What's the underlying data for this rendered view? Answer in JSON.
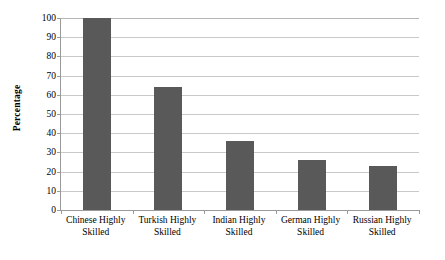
{
  "chart_data": {
    "type": "bar",
    "title": "",
    "xlabel": "",
    "ylabel": "Percentage",
    "ylim": [
      0,
      100
    ],
    "ytick_step": 10,
    "grid": true,
    "legend": "none",
    "bar_color": "#595959",
    "gridline_color": "#c9c9c9",
    "axis_color": "#9a9a9a",
    "categories": [
      "Chinese Highly Skilled",
      "Turkish Highly Skilled",
      "Indian Highly Skilled",
      "German Highly Skilled",
      "Russian Highly Skilled"
    ],
    "category_lines": [
      [
        "Chinese Highly",
        "Skilled"
      ],
      [
        "Turkish Highly",
        "Skilled"
      ],
      [
        "Indian Highly",
        "Skilled"
      ],
      [
        "German Highly",
        "Skilled"
      ],
      [
        "Russian Highly",
        "Skilled"
      ]
    ],
    "values": [
      100,
      64,
      36,
      26,
      23
    ],
    "yticks": [
      100,
      90,
      80,
      70,
      60,
      50,
      40,
      30,
      20,
      10,
      0
    ]
  }
}
